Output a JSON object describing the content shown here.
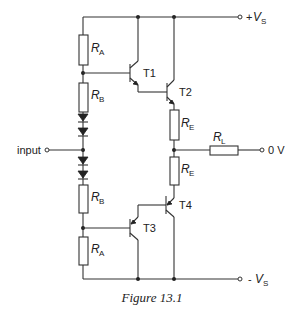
{
  "figure": {
    "caption": "Figure 13.1"
  },
  "terminals": {
    "positive_supply": {
      "prefix": "+",
      "symbol": "V",
      "subscript": "S"
    },
    "negative_supply": {
      "prefix": "- ",
      "symbol": "V",
      "subscript": "S"
    },
    "ground": "0 V",
    "input": "input"
  },
  "components": {
    "RA_top": {
      "symbol": "R",
      "subscript": "A"
    },
    "RB_top": {
      "symbol": "R",
      "subscript": "B"
    },
    "RB_bottom": {
      "symbol": "R",
      "subscript": "B"
    },
    "RA_bottom": {
      "symbol": "R",
      "subscript": "A"
    },
    "RE_top": {
      "symbol": "R",
      "subscript": "E"
    },
    "RE_bottom": {
      "symbol": "R",
      "subscript": "E"
    },
    "RL": {
      "symbol": "R",
      "subscript": "L"
    },
    "T1": "T1",
    "T2": "T2",
    "T3": "T3",
    "T4": "T4"
  },
  "diodes": {
    "count": 4
  }
}
